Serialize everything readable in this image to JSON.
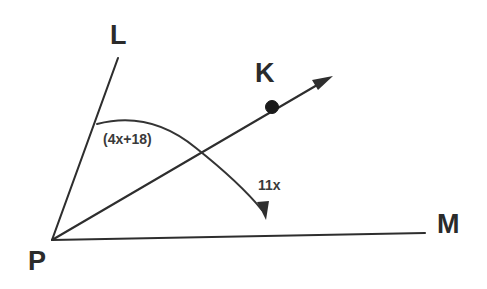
{
  "diagram": {
    "kind": "angle-diagram",
    "background_color": "#ffffff",
    "stroke_color": "#2e2e2e",
    "width": 487,
    "height": 289,
    "vertex": {
      "name": "P",
      "label": "P",
      "x": 52,
      "y": 240
    },
    "rays": [
      {
        "id": "ray-pl",
        "label": "L",
        "from": "P",
        "to_label": "L",
        "end_x": 118,
        "end_y": 58,
        "has_arrowhead": false
      },
      {
        "id": "ray-pk",
        "label": "K",
        "from": "P",
        "to_label": "K",
        "end_x": 332,
        "end_y": 78,
        "has_arrowhead": true,
        "marked_point": {
          "label": "K",
          "x": 272,
          "y": 107,
          "style": "filled-dot"
        }
      },
      {
        "id": "ray-pm",
        "label": "M",
        "from": "P",
        "to_label": "M",
        "end_x": 425,
        "end_y": 233,
        "has_arrowhead": false
      }
    ],
    "arcs": [
      {
        "id": "arc-angle-lpk",
        "measure_label": "(4x+18)",
        "from_ray": "ray-pl",
        "to_ray": "ray-pm",
        "has_arrowhead": true,
        "arrow_end": "lower"
      }
    ],
    "angle_labels": [
      {
        "id": "angle-lpk",
        "text": "(4x+18)",
        "x": 103,
        "y": 132
      },
      {
        "id": "angle-kpm",
        "text": "11x",
        "x": 258,
        "y": 178
      }
    ],
    "point_labels": [
      {
        "id": "label-L",
        "text": "L"
      },
      {
        "id": "label-K",
        "text": "K"
      },
      {
        "id": "label-M",
        "text": "M"
      },
      {
        "id": "label-P",
        "text": "P"
      }
    ]
  }
}
